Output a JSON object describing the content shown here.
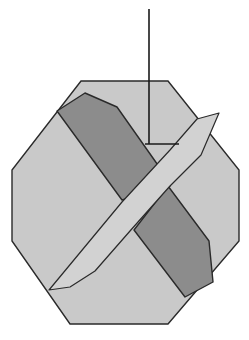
{
  "figure": {
    "colors": {
      "background": "#ffffff",
      "octagon_fill": "#c9c9c9",
      "dark_blade_fill": "#8c8c8c",
      "light_blade_fill": "#d2d2d2",
      "outline": "#2a2a2a"
    },
    "shapes": {
      "octagon": "81,81 168,81 239,170 239,241 168,324 70,324 12,241 12,170",
      "dark_blade_upper": "57,111 85,93 117,107 167,178 170,186 133,197 122,200",
      "dark_blade_lower": "168,186 209,241 213,282 185,297 134,230",
      "light_blade": "49,290 70,287 95,271 130,231 170,186 201,155 219,113 197,119 170,150 122,202",
      "vertical_line": {
        "x1": 149,
        "y1": 9,
        "x2": 149,
        "y2": 144
      },
      "tick_line": {
        "x1": 145,
        "y1": 144,
        "x2": 179,
        "y2": 144
      }
    }
  }
}
